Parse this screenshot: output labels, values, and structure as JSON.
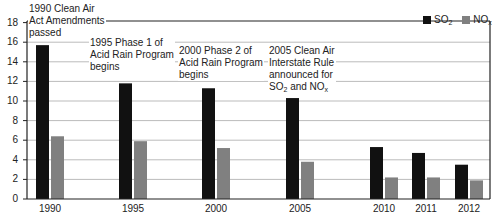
{
  "chart_data": {
    "type": "bar",
    "title": "",
    "xlabel": "",
    "ylabel": "",
    "ylim": [
      0,
      18
    ],
    "yticks": [
      0,
      2,
      4,
      6,
      8,
      10,
      12,
      14,
      16,
      18
    ],
    "grid": true,
    "legend_position": "top-right",
    "categories": [
      "1990",
      "1995",
      "2000",
      "2005",
      "2010",
      "2011",
      "2012"
    ],
    "series": [
      {
        "name": "SO2",
        "label_main": "SO",
        "label_sub": "2",
        "color": "#111111",
        "values": [
          15.7,
          11.8,
          11.3,
          10.3,
          5.3,
          4.7,
          3.5
        ]
      },
      {
        "name": "NOx",
        "label_main": "NO",
        "label_sub": "x",
        "color": "#808080",
        "values": [
          6.4,
          5.9,
          5.2,
          3.8,
          2.2,
          2.2,
          1.9
        ]
      }
    ],
    "annotations": [
      {
        "year": "1990",
        "lines": [
          "1990 Clean Air",
          "Act Amendments",
          "passed"
        ]
      },
      {
        "year": "1995",
        "lines": [
          "1995 Phase 1 of",
          "Acid Rain Program",
          "begins"
        ]
      },
      {
        "year": "2000",
        "lines": [
          "2000 Phase 2 of",
          "Acid Rain Program",
          "begins"
        ]
      },
      {
        "year": "2005",
        "lines": [
          "2005 Clean Air",
          "Interstate Rule",
          "announced for"
        ],
        "last_line": {
          "a": "SO",
          "a_sub": "2",
          "mid": " and NO",
          "b_sub": "x"
        }
      }
    ]
  }
}
